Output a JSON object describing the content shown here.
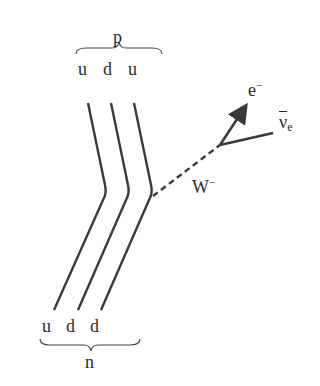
{
  "diagram": {
    "type": "feynman-beta-decay",
    "top_particle": {
      "label": "p",
      "quarks": [
        "u",
        "d",
        "u"
      ]
    },
    "bottom_particle": {
      "label": "n",
      "quarks": [
        "u",
        "d",
        "d"
      ]
    },
    "boson": {
      "label": "W",
      "charge": "−"
    },
    "outgoing": [
      {
        "label": "e",
        "superscript": "−"
      },
      {
        "label": "ν",
        "subscript": "e",
        "overline": true
      }
    ],
    "line_color": "#3a3a3a"
  }
}
